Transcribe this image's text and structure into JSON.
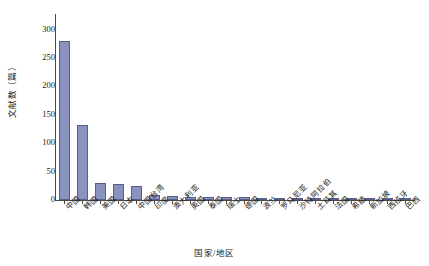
{
  "chart_data": {
    "type": "bar",
    "title": "",
    "xlabel": "国家/地区",
    "ylabel": "文献数（篇）",
    "ylim": [
      0,
      310
    ],
    "yticks": [
      0,
      50,
      100,
      150,
      200,
      250,
      300
    ],
    "ytick_labels": [
      "0",
      "50",
      "100",
      "150",
      "200",
      "250",
      "300"
    ],
    "grid": false,
    "legend": null,
    "bar_color": "#8a92bf",
    "bar_edge_color": "#5b5f86",
    "categories": [
      "中国",
      "韩国",
      "美国",
      "日本",
      "中国台湾",
      "印度",
      "澳大利亚",
      "英国",
      "泰国",
      "瑞士",
      "德国",
      "波兰",
      "罗马尼亚",
      "沙特阿拉伯",
      "土耳其",
      "法国",
      "希腊",
      "新加坡",
      "西班牙",
      "巴西"
    ],
    "values": [
      280,
      132,
      30,
      28,
      25,
      8,
      7,
      6,
      6,
      5,
      5,
      4,
      4,
      4,
      3,
      3,
      3,
      3,
      2,
      2
    ]
  }
}
